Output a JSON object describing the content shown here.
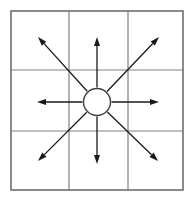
{
  "figure": {
    "background_color": "#ffffff",
    "width": 194,
    "height": 202
  },
  "grid": {
    "name": "3x3-grid",
    "rows": 3,
    "cols": 3,
    "line_color": "#808080",
    "border_color": "#6e6e6e",
    "line_width": 1.2,
    "border_width": 1.6,
    "bounds": {
      "left": 11,
      "top": 11,
      "right": 183,
      "bottom": 190
    },
    "vertical_lines_x": [
      69,
      128
    ],
    "horizontal_lines_y": [
      70,
      131
    ],
    "cells": [
      {
        "id": "cell-r1c1",
        "row": 1,
        "col": 1,
        "label": ""
      },
      {
        "id": "cell-r1c2",
        "row": 1,
        "col": 2,
        "label": ""
      },
      {
        "id": "cell-r1c3",
        "row": 1,
        "col": 3,
        "label": ""
      },
      {
        "id": "cell-r2c1",
        "row": 2,
        "col": 1,
        "label": ""
      },
      {
        "id": "cell-r2c2",
        "row": 2,
        "col": 2,
        "label": ""
      },
      {
        "id": "cell-r2c3",
        "row": 2,
        "col": 3,
        "label": ""
      },
      {
        "id": "cell-r3c1",
        "row": 3,
        "col": 1,
        "label": ""
      },
      {
        "id": "cell-r3c2",
        "row": 3,
        "col": 2,
        "label": ""
      },
      {
        "id": "cell-r3c3",
        "row": 3,
        "col": 3,
        "label": ""
      }
    ]
  },
  "center_node": {
    "name": "center-circle",
    "cx": 97,
    "cy": 102,
    "r": 13.5,
    "fill": "#ffffff",
    "stroke": "#404040",
    "stroke_width": 1.4,
    "label": ""
  },
  "arrows": {
    "color": "#1a1a1a",
    "stroke_width": 1.3,
    "head_length": 9,
    "head_width": 6,
    "start_radius": 14.5,
    "items": [
      {
        "id": "arrow-north",
        "direction": "N",
        "angle_deg": 90,
        "tip_x": 97,
        "tip_y": 37,
        "label": ""
      },
      {
        "id": "arrow-northeast",
        "direction": "NE",
        "angle_deg": 45,
        "tip_x": 159,
        "tip_y": 37,
        "label": ""
      },
      {
        "id": "arrow-east",
        "direction": "E",
        "angle_deg": 0,
        "tip_x": 159,
        "tip_y": 102,
        "label": ""
      },
      {
        "id": "arrow-southeast",
        "direction": "SE",
        "angle_deg": -45,
        "tip_x": 158,
        "tip_y": 161,
        "label": ""
      },
      {
        "id": "arrow-south",
        "direction": "S",
        "angle_deg": -90,
        "tip_x": 97,
        "tip_y": 164,
        "label": ""
      },
      {
        "id": "arrow-southwest",
        "direction": "SW",
        "angle_deg": -135,
        "tip_x": 38,
        "tip_y": 161,
        "label": ""
      },
      {
        "id": "arrow-west",
        "direction": "W",
        "angle_deg": 180,
        "tip_x": 37,
        "tip_y": 102,
        "label": ""
      },
      {
        "id": "arrow-northwest",
        "direction": "NW",
        "angle_deg": 135,
        "tip_x": 38,
        "tip_y": 37,
        "label": ""
      }
    ]
  }
}
